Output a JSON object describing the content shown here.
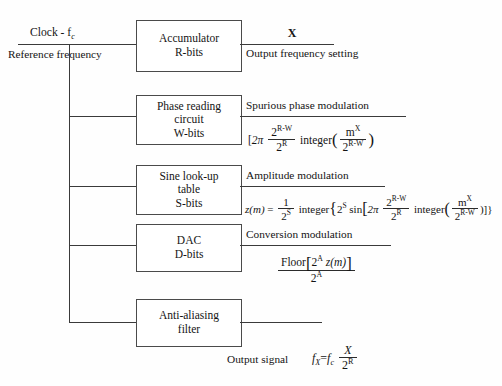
{
  "diagram": {
    "line_color": "#3a3a3a",
    "background": "#fefefe",
    "inputs": {
      "clock_label": "Clock - f",
      "clock_sub": "c",
      "reference_line1": "Reference",
      "reference_line2": "frequency"
    },
    "blocks": [
      {
        "id": "accumulator",
        "lines": [
          "Accumulator",
          "R-bits"
        ]
      },
      {
        "id": "phase-reading-circuit",
        "lines": [
          "Phase reading",
          "circuit",
          "W-bits"
        ]
      },
      {
        "id": "sine-lookup-table",
        "lines": [
          "Sine look-up",
          "table",
          "S-bits"
        ]
      },
      {
        "id": "dac",
        "lines": [
          "DAC",
          "D-bits"
        ]
      },
      {
        "id": "anti-aliasing-filter",
        "lines": [
          "Anti-aliasing",
          "filter"
        ]
      }
    ],
    "outputs": {
      "accumulator": {
        "symbol": "X",
        "caption_line1": "Output frequency",
        "caption_line2": "setting"
      },
      "phase": {
        "caption": "Spurious phase modulation",
        "formula_text": "[2π (2^(R-W) / 2^R) integer ( m^X / 2^(R-W) )",
        "bracket": "[",
        "two_pi": "2π",
        "frac1_num": "2",
        "frac1_num_sup": "R-W",
        "frac1_den": "2",
        "frac1_den_sup": "R",
        "integer_word": "integer",
        "frac2_num": "m",
        "frac2_num_sup": "X",
        "frac2_den": "2",
        "frac2_den_sup": "R-W"
      },
      "sine": {
        "caption": "Amplitude modulation",
        "formula_text": "z(m) = (1 / 2^S) integer { 2^S sin[ 2π (2^(R-W)/2^R) integer ( m^X / 2^(R-W) ) ] }",
        "lhs": "z(m)",
        "equals": "=",
        "frac_lead_num": "1",
        "frac_lead_den": "2",
        "frac_lead_den_sup": "S",
        "integer_word": "integer",
        "brace_open": "{",
        "two_pow_s": "2",
        "two_pow_s_sup": "S",
        "sin_word": "sin",
        "bracket_open": "[",
        "two_pi": "2π",
        "frac1_num": "2",
        "frac1_num_sup": "R-W",
        "frac1_den": "2",
        "frac1_den_sup": "R",
        "integer_word2": "integer",
        "frac2_num": "m",
        "frac2_num_sup": "X",
        "frac2_den": "2",
        "frac2_den_sup": "R-W",
        "closers": ")]}"
      },
      "dac": {
        "caption": "Conversion modulation",
        "formula_text": "Floor[2^A z(m)] / 2^A",
        "floor_word": "Floor",
        "bracket_open": "[",
        "two": "2",
        "two_sup": "A",
        "zm": "z(m)",
        "bracket_close": "]",
        "den": "2",
        "den_sup": "A"
      },
      "signal": {
        "caption": "Output signal",
        "formula_text": "f_X = f_c X / 2^R",
        "f": "f",
        "f_sub": "X",
        "equals": "=",
        "f2": "f",
        "f2_sub": "c",
        "num": "X",
        "den": "2",
        "den_sup": "R"
      }
    }
  }
}
